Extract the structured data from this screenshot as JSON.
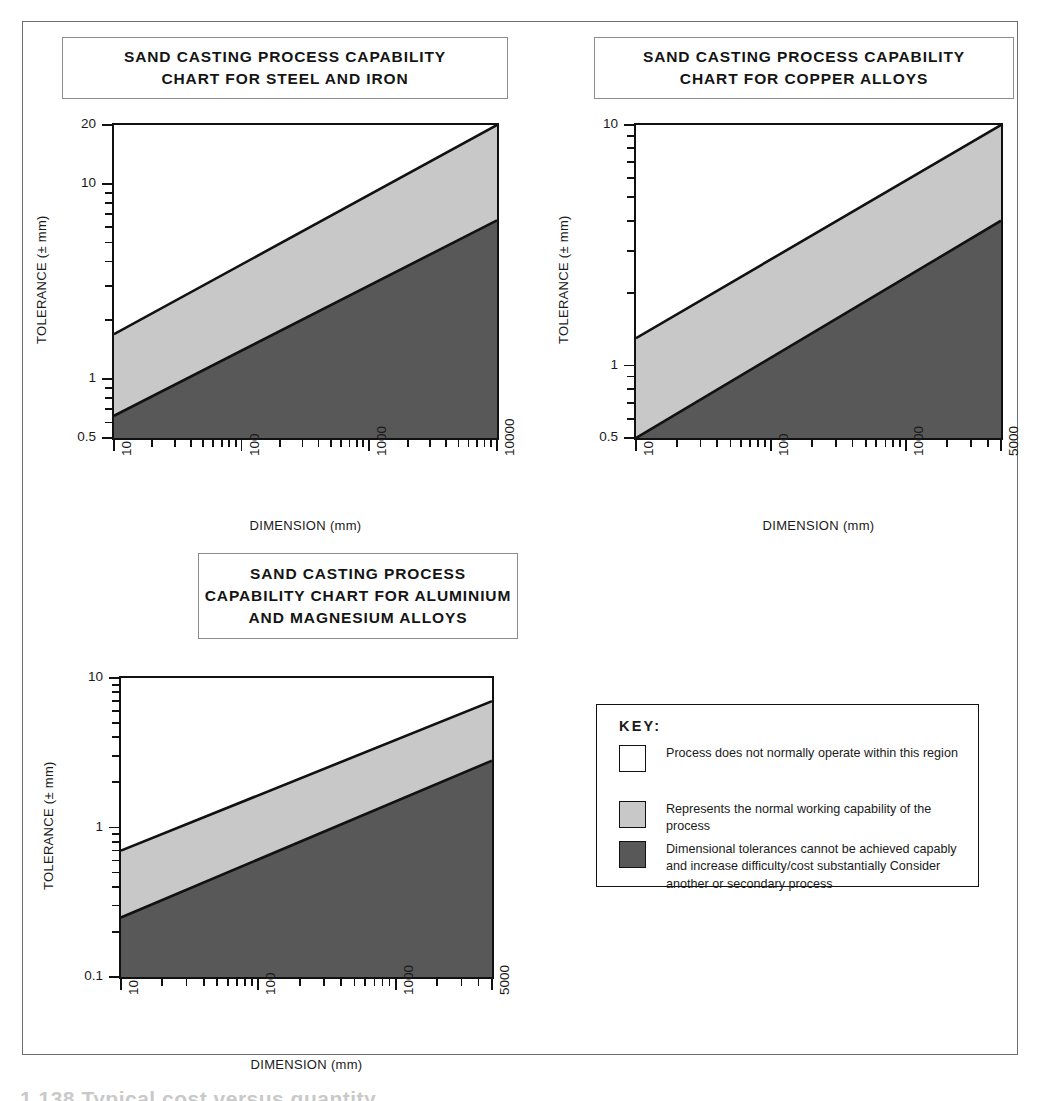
{
  "page": {
    "artifact_text": "1.138 Typical cost versus quantity"
  },
  "key": {
    "title": "KEY:",
    "rows": [
      {
        "swatch": "#ffffff",
        "text": "Process does not normally operate within this region"
      },
      {
        "swatch": "#c8c8c8",
        "text": "Represents the normal working capability of the process"
      },
      {
        "swatch": "#585858",
        "text": "Dimensional tolerances cannot be achieved capably and increase difficulty/cost substantially Consider another or secondary process"
      }
    ]
  },
  "colors": {
    "not_operating": "#ffffff",
    "normal_capability": "#c8c8c8",
    "not_capable": "#585858",
    "line": "#111111",
    "frame": "#6e6e6e"
  },
  "chart_data": [
    {
      "id": "steel-iron",
      "type": "area",
      "title_lines": [
        "SAND CASTING PROCESS CAPABILITY",
        "CHART FOR STEEL AND IRON"
      ],
      "xlabel": "DIMENSION (mm)",
      "ylabel": "TOLERANCE (± mm)",
      "xscale": "log",
      "yscale": "log",
      "xlim": [
        10,
        10000
      ],
      "ylim": [
        0.5,
        20
      ],
      "xticks": [
        10,
        100,
        1000,
        10000
      ],
      "xticklabels": [
        "10",
        "100",
        "1000",
        "10000"
      ],
      "yticks": [
        0.5,
        1,
        10,
        20
      ],
      "yticklabels": [
        "0.5",
        "1",
        "10",
        "20"
      ],
      "grid": false,
      "series": [
        {
          "name": "upper boundary (normal capability limit)",
          "x": [
            10,
            10000
          ],
          "y": [
            1.7,
            20.0
          ]
        },
        {
          "name": "lower boundary (not capable limit)",
          "x": [
            10,
            10000
          ],
          "y": [
            0.65,
            6.5
          ]
        }
      ],
      "regions": [
        {
          "name": "Process does not normally operate within this region",
          "fill": "#ffffff"
        },
        {
          "name": "Represents the normal working capability of the process",
          "fill": "#c8c8c8"
        },
        {
          "name": "Dimensional tolerances cannot be achieved capably",
          "fill": "#585858"
        }
      ]
    },
    {
      "id": "copper-alloys",
      "type": "area",
      "title_lines": [
        "SAND CASTING PROCESS CAPABILITY",
        "CHART FOR COPPER ALLOYS"
      ],
      "xlabel": "DIMENSION (mm)",
      "ylabel": "TOLERANCE (± mm)",
      "xscale": "log",
      "yscale": "log",
      "xlim": [
        10,
        5000
      ],
      "ylim": [
        0.5,
        10
      ],
      "xticks": [
        10,
        100,
        1000,
        5000
      ],
      "xticklabels": [
        "10",
        "100",
        "1000",
        "5000"
      ],
      "yticks": [
        0.5,
        1,
        10
      ],
      "yticklabels": [
        "0.5",
        "1",
        "10"
      ],
      "grid": false,
      "series": [
        {
          "name": "upper boundary (normal capability limit)",
          "x": [
            10,
            5000
          ],
          "y": [
            1.3,
            10.0
          ]
        },
        {
          "name": "lower boundary (not capable limit)",
          "x": [
            10,
            5000
          ],
          "y": [
            0.5,
            4.0
          ]
        }
      ],
      "regions": [
        {
          "name": "Process does not normally operate within this region",
          "fill": "#ffffff"
        },
        {
          "name": "Represents the normal working capability of the process",
          "fill": "#c8c8c8"
        },
        {
          "name": "Dimensional tolerances cannot be achieved capably",
          "fill": "#585858"
        }
      ]
    },
    {
      "id": "aluminium-magnesium",
      "type": "area",
      "title_lines": [
        "SAND CASTING PROCESS",
        "CAPABILITY CHART FOR ALUMINIUM",
        "AND MAGNESIUM ALLOYS"
      ],
      "xlabel": "DIMENSION (mm)",
      "ylabel": "TOLERANCE (± mm)",
      "xscale": "log",
      "yscale": "log",
      "xlim": [
        10,
        5000
      ],
      "ylim": [
        0.1,
        10
      ],
      "xticks": [
        10,
        100,
        1000,
        5000
      ],
      "xticklabels": [
        "10",
        "100",
        "1000",
        "5000"
      ],
      "yticks": [
        0.1,
        1,
        10
      ],
      "yticklabels": [
        "0.1",
        "1",
        "10"
      ],
      "grid": false,
      "series": [
        {
          "name": "upper boundary (normal capability limit)",
          "x": [
            10,
            5000
          ],
          "y": [
            0.7,
            7.0
          ]
        },
        {
          "name": "lower boundary (not capable limit)",
          "x": [
            10,
            5000
          ],
          "y": [
            0.25,
            2.8
          ]
        }
      ],
      "regions": [
        {
          "name": "Process does not normally operate within this region",
          "fill": "#ffffff"
        },
        {
          "name": "Represents the normal working capability of the process",
          "fill": "#c8c8c8"
        },
        {
          "name": "Dimensional tolerances cannot be achieved capably",
          "fill": "#585858"
        }
      ]
    }
  ],
  "layout": {
    "charts": [
      {
        "id": "steel-iron",
        "title_box": {
          "left": 62,
          "top": 37,
          "width": 446,
          "height": 62
        },
        "plot": {
          "left": 112,
          "top": 123,
          "width": 387,
          "height": 317
        }
      },
      {
        "id": "copper-alloys",
        "title_box": {
          "left": 594,
          "top": 37,
          "width": 420,
          "height": 62
        },
        "plot": {
          "left": 634,
          "top": 123,
          "width": 369,
          "height": 317
        }
      },
      {
        "id": "aluminium-magnesium",
        "title_box": {
          "left": 198,
          "top": 553,
          "width": 320,
          "height": 86
        },
        "plot": {
          "left": 119,
          "top": 676,
          "width": 375,
          "height": 303
        }
      }
    ]
  }
}
